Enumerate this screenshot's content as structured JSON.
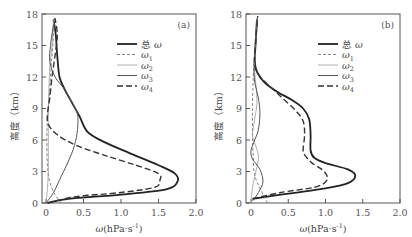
{
  "chart_data": [
    {
      "type": "line",
      "panel_label": "(a)",
      "xlabel": "ω(hPa·s⁻¹)",
      "ylabel": "高度（km）",
      "xlim": [
        0,
        2.0
      ],
      "ylim": [
        0,
        18
      ],
      "xticks": [
        "0",
        "0.5",
        "1.0",
        "1.5",
        "2.0"
      ],
      "yticks": [
        "0",
        "3",
        "6",
        "9",
        "12",
        "15",
        "18"
      ],
      "grid": false,
      "legend_position": "upper right",
      "series": [
        {
          "name": "总 ω",
          "style": "solid-thick",
          "color": "#222222",
          "points": [
            [
              0.02,
              0
            ],
            [
              0.3,
              0.4
            ],
            [
              1.0,
              0.8
            ],
            [
              1.6,
              1.3
            ],
            [
              1.75,
              2.0
            ],
            [
              1.72,
              2.8
            ],
            [
              1.5,
              3.6
            ],
            [
              1.1,
              4.8
            ],
            [
              0.75,
              5.9
            ],
            [
              0.55,
              6.8
            ],
            [
              0.45,
              8.2
            ],
            [
              0.35,
              9.5
            ],
            [
              0.25,
              10.8
            ],
            [
              0.18,
              12.0
            ],
            [
              0.15,
              14.0
            ],
            [
              0.13,
              16.0
            ],
            [
              0.1,
              17.5
            ]
          ]
        },
        {
          "name": "ω1",
          "style": "dashed-thin",
          "color": "#777777",
          "points": [
            [
              0.2,
              0
            ],
            [
              0.12,
              0.8
            ],
            [
              0.05,
              2.0
            ],
            [
              0.02,
              3.5
            ],
            [
              0.01,
              6.0
            ],
            [
              0.02,
              8.0
            ],
            [
              0.04,
              10.0
            ],
            [
              0.06,
              12.0
            ],
            [
              0.08,
              14.0
            ],
            [
              0.1,
              16.0
            ],
            [
              0.11,
              17.6
            ]
          ]
        },
        {
          "name": "ω2",
          "style": "solid-thin",
          "color": "#999999",
          "points": [
            [
              0.0,
              0
            ],
            [
              0.02,
              1.5
            ],
            [
              0.03,
              3.0
            ],
            [
              0.03,
              5.0
            ],
            [
              0.03,
              7.0
            ],
            [
              0.03,
              9.0
            ],
            [
              0.04,
              11.0
            ],
            [
              0.05,
              13.0
            ],
            [
              0.08,
              15.0
            ],
            [
              0.1,
              17.5
            ]
          ]
        },
        {
          "name": "ω3",
          "style": "solid-medium",
          "color": "#555555",
          "points": [
            [
              0.0,
              0
            ],
            [
              0.1,
              1.0
            ],
            [
              0.2,
              2.5
            ],
            [
              0.3,
              4.0
            ],
            [
              0.38,
              5.5
            ],
            [
              0.42,
              7.0
            ],
            [
              0.42,
              8.5
            ],
            [
              0.35,
              9.5
            ],
            [
              0.25,
              10.8
            ],
            [
              0.12,
              12.0
            ],
            [
              0.05,
              13.5
            ],
            [
              0.06,
              15.0
            ],
            [
              0.1,
              17.0
            ]
          ]
        },
        {
          "name": "ω4",
          "style": "dashed-thick",
          "color": "#333333",
          "points": [
            [
              0.02,
              0
            ],
            [
              0.4,
              0.6
            ],
            [
              1.0,
              1.0
            ],
            [
              1.45,
              1.5
            ],
            [
              1.52,
              2.2
            ],
            [
              1.5,
              2.8
            ],
            [
              1.2,
              3.6
            ],
            [
              0.8,
              4.5
            ],
            [
              0.4,
              5.5
            ],
            [
              0.15,
              6.5
            ],
            [
              0.03,
              7.5
            ],
            [
              0.02,
              8.5
            ],
            [
              0.05,
              10.0
            ],
            [
              0.08,
              12.0
            ],
            [
              0.12,
              14.0
            ],
            [
              0.15,
              16.0
            ],
            [
              0.12,
              17.6
            ]
          ]
        }
      ]
    },
    {
      "type": "line",
      "panel_label": "(b)",
      "xlabel": "ω(hPa·s⁻¹)",
      "ylabel": "高度（km）",
      "xlim": [
        0,
        2.0
      ],
      "ylim": [
        0,
        18
      ],
      "xticks": [
        "0",
        "0.5",
        "1.0",
        "1.5",
        "2.0"
      ],
      "yticks": [
        "0",
        "3",
        "6",
        "9",
        "12",
        "15",
        "18"
      ],
      "grid": false,
      "legend_position": "upper right",
      "series": [
        {
          "name": "总 ω",
          "style": "solid-thick",
          "color": "#222222",
          "points": [
            [
              0.02,
              0.4
            ],
            [
              0.5,
              0.9
            ],
            [
              1.0,
              1.4
            ],
            [
              1.3,
              1.9
            ],
            [
              1.4,
              2.6
            ],
            [
              1.3,
              3.2
            ],
            [
              1.0,
              3.8
            ],
            [
              0.85,
              4.3
            ],
            [
              0.8,
              5.0
            ],
            [
              0.8,
              6.5
            ],
            [
              0.78,
              8.0
            ],
            [
              0.7,
              9.0
            ],
            [
              0.55,
              9.8
            ],
            [
              0.35,
              10.6
            ],
            [
              0.18,
              11.5
            ],
            [
              0.08,
              12.5
            ],
            [
              0.05,
              13.5
            ],
            [
              0.06,
              15.0
            ],
            [
              0.08,
              17.5
            ]
          ]
        },
        {
          "name": "ω1",
          "style": "dashed-thin",
          "color": "#777777",
          "points": [
            [
              0.22,
              0
            ],
            [
              0.15,
              1.0
            ],
            [
              0.08,
              2.0
            ],
            [
              0.04,
              3.0
            ],
            [
              0.03,
              4.5
            ],
            [
              0.02,
              6.0
            ],
            [
              0.02,
              9.0
            ],
            [
              0.03,
              12.0
            ],
            [
              0.05,
              14.0
            ],
            [
              0.07,
              16.0
            ],
            [
              0.08,
              17.6
            ]
          ]
        },
        {
          "name": "ω2",
          "style": "solid-thin",
          "color": "#999999",
          "points": [
            [
              0.0,
              0
            ],
            [
              0.02,
              1.5
            ],
            [
              0.08,
              3.5
            ],
            [
              0.1,
              4.5
            ],
            [
              0.06,
              5.5
            ],
            [
              0.02,
              6.5
            ],
            [
              0.05,
              8.0
            ],
            [
              0.08,
              9.5
            ],
            [
              0.07,
              11.0
            ],
            [
              0.05,
              12.5
            ],
            [
              0.05,
              14.0
            ],
            [
              0.07,
              16.0
            ],
            [
              0.08,
              17.6
            ]
          ]
        },
        {
          "name": "ω3",
          "style": "solid-medium",
          "color": "#555555",
          "points": [
            [
              0.02,
              0.2
            ],
            [
              0.1,
              1.0
            ],
            [
              0.16,
              2.0
            ],
            [
              0.12,
              3.2
            ],
            [
              0.02,
              4.2
            ],
            [
              0.0,
              5.0
            ],
            [
              0.05,
              6.0
            ],
            [
              0.1,
              7.0
            ],
            [
              0.12,
              8.5
            ],
            [
              0.1,
              10.0
            ],
            [
              0.05,
              11.5
            ],
            [
              0.04,
              13.0
            ],
            [
              0.06,
              15.0
            ],
            [
              0.09,
              17.8
            ]
          ]
        },
        {
          "name": "ω4",
          "style": "dashed-thick",
          "color": "#333333",
          "points": [
            [
              0.02,
              0.4
            ],
            [
              0.4,
              1.0
            ],
            [
              0.85,
              1.5
            ],
            [
              1.0,
              2.0
            ],
            [
              1.02,
              2.6
            ],
            [
              0.95,
              3.2
            ],
            [
              0.82,
              3.8
            ],
            [
              0.74,
              4.4
            ],
            [
              0.7,
              5.0
            ],
            [
              0.72,
              6.5
            ],
            [
              0.7,
              7.8
            ],
            [
              0.6,
              8.8
            ],
            [
              0.45,
              9.8
            ],
            [
              0.3,
              10.8
            ],
            [
              0.15,
              11.8
            ],
            [
              0.06,
              12.8
            ],
            [
              0.05,
              14.0
            ],
            [
              0.07,
              16.0
            ],
            [
              0.09,
              17.8
            ]
          ]
        }
      ]
    }
  ],
  "legend": {
    "items": [
      {
        "label_prefix": "总 ",
        "symbol": "ω",
        "sub": ""
      },
      {
        "label_prefix": "",
        "symbol": "ω",
        "sub": "1"
      },
      {
        "label_prefix": "",
        "symbol": "ω",
        "sub": "2"
      },
      {
        "label_prefix": "",
        "symbol": "ω",
        "sub": "3"
      },
      {
        "label_prefix": "",
        "symbol": "ω",
        "sub": "4"
      }
    ]
  },
  "axes": {
    "xlabel_main": "ω",
    "xlabel_units": "(hPa·s",
    "xlabel_exp": "-1",
    "xlabel_close": ")",
    "ylabel": "高度（km）"
  }
}
